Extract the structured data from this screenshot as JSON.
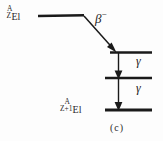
{
  "figure": {
    "caption": "(c)",
    "background_color": "#fdfdfd",
    "ink_color": "#1a1a1a"
  },
  "parent_nuclide": {
    "mass_number": "A",
    "atomic_number": "Z",
    "element_symbol": "El"
  },
  "daughter_nuclide": {
    "mass_number": "A",
    "atomic_number": "Z+1",
    "element_symbol": "El"
  },
  "transitions": {
    "beta": {
      "symbol": "β",
      "charge": "−"
    },
    "gamma_upper": {
      "symbol": "γ"
    },
    "gamma_lower": {
      "symbol": "γ"
    }
  },
  "levels": [
    {
      "name": "parent-ground-level"
    },
    {
      "name": "daughter-excited-level-2"
    },
    {
      "name": "daughter-excited-level-1"
    },
    {
      "name": "daughter-ground-level"
    }
  ]
}
